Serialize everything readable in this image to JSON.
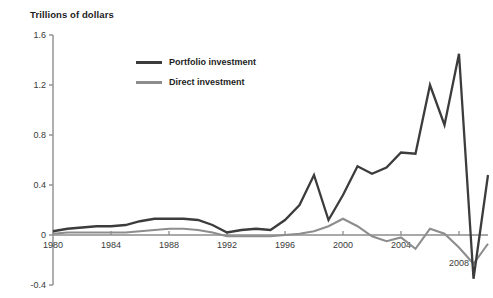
{
  "chart_data": {
    "type": "line",
    "title": "Trillions of dollars",
    "subtitle": "",
    "xlabel": "",
    "ylabel": "",
    "xlim": [
      1980,
      2010
    ],
    "ylim": [
      -0.4,
      1.6
    ],
    "yticks": [
      "1.6",
      "1.2",
      "0.8",
      "0.4",
      "0",
      "-0.4"
    ],
    "ytick_values": [
      1.6,
      1.2,
      0.8,
      0.4,
      0,
      -0.4
    ],
    "xticks": [
      "1980",
      "1984",
      "1988",
      "1992",
      "1996",
      "2000",
      "2004",
      "2008"
    ],
    "xtick_values": [
      1980,
      1984,
      1988,
      1992,
      1996,
      2000,
      2004,
      2008
    ],
    "grid": false,
    "legend_position": "upper-center-left",
    "x": [
      1980,
      1981,
      1982,
      1983,
      1984,
      1985,
      1986,
      1987,
      1988,
      1989,
      1990,
      1991,
      1992,
      1993,
      1994,
      1995,
      1996,
      1997,
      1998,
      1999,
      2000,
      2001,
      2002,
      2003,
      2004,
      2005,
      2006,
      2007,
      2008,
      2009,
      2010
    ],
    "series": [
      {
        "name": "Portfolio investment",
        "color": "#3c3c3c",
        "values": [
          0.03,
          0.05,
          0.06,
          0.07,
          0.07,
          0.08,
          0.11,
          0.13,
          0.13,
          0.13,
          0.12,
          0.08,
          0.02,
          0.04,
          0.05,
          0.04,
          0.12,
          0.24,
          0.48,
          0.12,
          0.32,
          0.55,
          0.49,
          0.54,
          0.66,
          0.65,
          1.2,
          0.88,
          1.45,
          -0.35,
          0.48
        ]
      },
      {
        "name": "Direct investment",
        "color": "#8d8d8d",
        "values": [
          0.01,
          0.02,
          0.02,
          0.02,
          0.02,
          0.02,
          0.03,
          0.04,
          0.05,
          0.05,
          0.04,
          0.02,
          -0.01,
          -0.01,
          -0.01,
          -0.01,
          0.0,
          0.01,
          0.03,
          0.07,
          0.13,
          0.07,
          -0.01,
          -0.05,
          -0.02,
          -0.11,
          0.05,
          0.01,
          -0.1,
          -0.23,
          -0.07
        ]
      }
    ],
    "annotations": []
  },
  "legend": {
    "items": [
      {
        "label": "Portfolio investment",
        "color": "#3c3c3c"
      },
      {
        "label": "Direct investment",
        "color": "#8d8d8d"
      }
    ]
  },
  "axes": {
    "axis_color": "#8d8d8d",
    "zero_line_color": "#8d8d8d"
  }
}
